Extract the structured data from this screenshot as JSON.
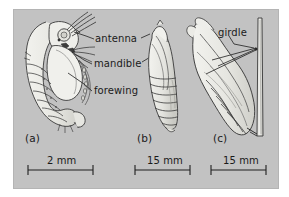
{
  "figure": {
    "panel_background": "#c2c2c2",
    "page_background": "#ffffff",
    "ink_color": "#2b2b2b",
    "body_fill": "#e8e8e4",
    "panels": [
      {
        "letter": "(a)",
        "subject": "curved exarate pupa with free appendages",
        "scale_value": "2 mm"
      },
      {
        "letter": "(b)",
        "subject": "obtect segmented pupa",
        "scale_value": "15 mm"
      },
      {
        "letter": "(c)",
        "subject": "chrysalis attached to stem by silk girdle",
        "scale_value": "15 mm"
      }
    ],
    "callouts": [
      {
        "label": "antenna",
        "panel": "(a)"
      },
      {
        "label": "mandible",
        "panel": "(a)"
      },
      {
        "label": "forewing",
        "panel": "(a)"
      },
      {
        "label": "girdle",
        "panel": "(c)"
      }
    ],
    "scale_bars": [
      {
        "label": "2 mm",
        "panel": "(a)"
      },
      {
        "label": "15 mm",
        "panel": "(b)"
      },
      {
        "label": "15 mm",
        "panel": "(c)"
      }
    ]
  }
}
